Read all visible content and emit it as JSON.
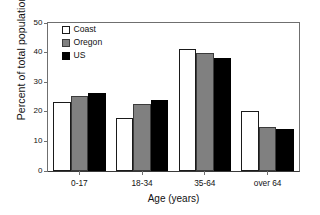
{
  "chart_data": {
    "type": "bar",
    "title": "",
    "xlabel": "Age (years)",
    "ylabel": "Percent of total population",
    "categories": [
      "0-17",
      "18-34",
      "35-64",
      "over 64"
    ],
    "series": [
      {
        "name": "Coast",
        "color": "#ffffff",
        "values": [
          23.3,
          17.8,
          41.2,
          20.4
        ]
      },
      {
        "name": "Oregon",
        "color": "#808080",
        "values": [
          25.3,
          22.5,
          40.0,
          14.8
        ]
      },
      {
        "name": "US",
        "color": "#000000",
        "values": [
          26.2,
          24.0,
          38.2,
          14.2
        ]
      }
    ],
    "ylim": [
      0,
      50
    ],
    "yticks": [
      0,
      10,
      20,
      30,
      40,
      50
    ],
    "ytick_labels": [
      "0",
      "10",
      "20",
      "30",
      "40",
      "50"
    ],
    "grid": false,
    "legend_position": "top-left"
  }
}
